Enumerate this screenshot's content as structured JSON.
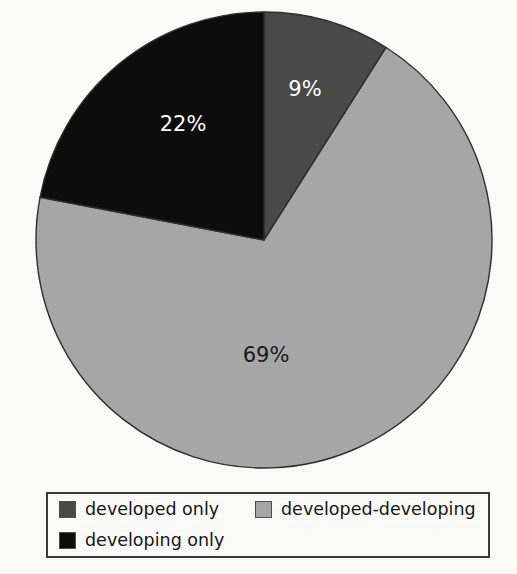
{
  "chart_data": {
    "type": "pie",
    "title": "",
    "categories": [
      "developed only",
      "developed-developing",
      "developing only"
    ],
    "values": [
      9,
      69,
      22
    ],
    "labels": [
      "9%",
      "69%",
      "22%"
    ],
    "unit": "%",
    "start_angle_deg": 0,
    "direction": "clockwise",
    "colors": [
      "#4a4a4a",
      "#a8a8a8",
      "#0d0d0d"
    ],
    "label_colors": [
      "#ffffff",
      "#1a1a1a",
      "#ffffff"
    ],
    "legend_position": "bottom",
    "grid": false,
    "xlabel": "",
    "ylabel": ""
  },
  "pie": {
    "center_x": 264,
    "center_y": 240,
    "radius": 228,
    "outline_color": "#2e2e2e",
    "slices": [
      {
        "name": "developed only",
        "label": "9%",
        "value": 9,
        "color": "#4a4a4a",
        "label_color": "#ffffff",
        "label_x": 305,
        "label_y": 90
      },
      {
        "name": "developed-developing",
        "label": "69%",
        "value": 69,
        "color": "#a8a8a8",
        "label_color": "#1a1a1a",
        "label_x": 266,
        "label_y": 356
      },
      {
        "name": "developing only",
        "label": "22%",
        "value": 22,
        "color": "#0d0d0d",
        "label_color": "#ffffff",
        "label_x": 183,
        "label_y": 125
      }
    ]
  },
  "legend": {
    "rows": [
      [
        {
          "label": "developed only",
          "color": "#4a4a4a"
        },
        {
          "label": "developed-developing",
          "color": "#a8a8a8"
        }
      ],
      [
        {
          "label": "developing only",
          "color": "#0d0d0d"
        }
      ]
    ]
  }
}
